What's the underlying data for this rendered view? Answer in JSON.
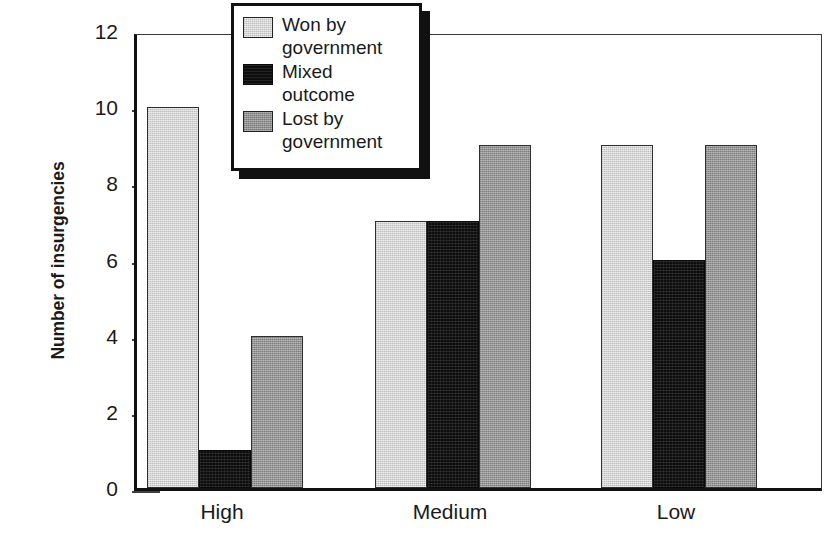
{
  "chart_data": {
    "type": "bar",
    "title": "",
    "subtitle": "",
    "xlabel": "",
    "ylabel": "Number of insurgencies",
    "categories": [
      "High",
      "Medium",
      "Low"
    ],
    "series": [
      {
        "name": "Won by government",
        "values": [
          10,
          7,
          9
        ],
        "color": "#d4d4d4"
      },
      {
        "name": "Mixed outcome",
        "values": [
          1,
          7,
          6
        ],
        "color": "#0d0d0d"
      },
      {
        "name": "Lost by government",
        "values": [
          4,
          9,
          9
        ],
        "color": "#959595"
      }
    ],
    "ylim": [
      0,
      12
    ],
    "yticks": [
      0,
      2,
      4,
      6,
      8,
      10,
      12
    ],
    "ytick_labels": [
      "0",
      "2",
      "4",
      "6",
      "8",
      "10",
      "12"
    ],
    "grid": false,
    "legend_position": "top-center",
    "legend_entries": [
      {
        "label_line1": "Won by",
        "label_line2": "government",
        "swatch": "light-gray"
      },
      {
        "label_line1": "Mixed",
        "label_line2": "outcome",
        "swatch": "black"
      },
      {
        "label_line1": "Lost by",
        "label_line2": "government",
        "swatch": "dark-gray"
      }
    ]
  }
}
